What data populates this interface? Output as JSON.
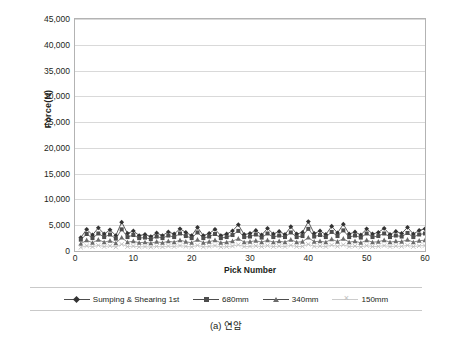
{
  "caption": "(a) 연암",
  "chart_data": {
    "type": "line",
    "title": "",
    "xlabel": "Pick Number",
    "ylabel": "Force(N)",
    "xlim": [
      0,
      60
    ],
    "ylim": [
      0,
      45000
    ],
    "grid": "horizontal",
    "legend_position": "bottom",
    "y_ticks": [
      0,
      5000,
      10000,
      15000,
      20000,
      25000,
      30000,
      35000,
      40000,
      45000
    ],
    "y_tick_labels": [
      "0",
      "5,000",
      "10,000",
      "15,000",
      "20,000",
      "25,000",
      "30,000",
      "35,000",
      "40,000",
      "45,000"
    ],
    "x_ticks": [
      0,
      10,
      20,
      30,
      40,
      50,
      60
    ],
    "x_tick_labels": [
      "0",
      "10",
      "20",
      "30",
      "40",
      "50",
      "60"
    ],
    "x": [
      1,
      2,
      3,
      4,
      5,
      6,
      7,
      8,
      9,
      10,
      11,
      12,
      13,
      14,
      15,
      16,
      17,
      18,
      19,
      20,
      21,
      22,
      23,
      24,
      25,
      26,
      27,
      28,
      29,
      30,
      31,
      32,
      33,
      34,
      35,
      36,
      37,
      38,
      39,
      40,
      41,
      42,
      43,
      44,
      45,
      46,
      47,
      48,
      49,
      50,
      51,
      52,
      53,
      54,
      55,
      56,
      57,
      58,
      59,
      60
    ],
    "series": [
      {
        "name": "Sumping & Shearing 1st",
        "marker": "diamond",
        "color": "#333333",
        "values": [
          2600,
          4200,
          3100,
          4500,
          3300,
          4100,
          3000,
          5600,
          3400,
          3900,
          3000,
          3200,
          2800,
          3500,
          3000,
          3700,
          3300,
          4300,
          3600,
          3000,
          4600,
          3000,
          3400,
          4200,
          3000,
          3300,
          3900,
          5100,
          3200,
          3400,
          4000,
          3100,
          4400,
          3300,
          3800,
          3200,
          4700,
          3300,
          3600,
          5700,
          3400,
          3900,
          3200,
          4800,
          3500,
          5200,
          3300,
          3700,
          3100,
          4300,
          3300,
          3600,
          4400,
          3200,
          3800,
          3400,
          4600,
          3300,
          4000,
          4300
        ]
      },
      {
        "name": "680mm",
        "marker": "square",
        "color": "#4d4d4d",
        "values": [
          2200,
          3300,
          2500,
          3400,
          2700,
          3200,
          2400,
          4200,
          2700,
          3100,
          2500,
          2600,
          2300,
          2800,
          2500,
          3000,
          2700,
          3400,
          2900,
          2500,
          3600,
          2500,
          2800,
          3300,
          2500,
          2700,
          3100,
          3900,
          2700,
          2800,
          3200,
          2600,
          3400,
          2700,
          3000,
          2700,
          3600,
          2700,
          2900,
          4300,
          2800,
          3100,
          2700,
          3700,
          2900,
          4000,
          2700,
          3000,
          2600,
          3400,
          2700,
          2900,
          3400,
          2700,
          3000,
          2800,
          3500,
          2700,
          3200,
          3400
        ]
      },
      {
        "name": "340mm",
        "marker": "triangle",
        "color": "#6b6b6b",
        "values": [
          1400,
          2100,
          1600,
          2200,
          1700,
          2000,
          1500,
          2600,
          1700,
          1900,
          1600,
          1700,
          1500,
          1800,
          1600,
          1900,
          1700,
          2100,
          1800,
          1600,
          2200,
          1600,
          1800,
          2100,
          1600,
          1700,
          1900,
          2400,
          1700,
          1800,
          2000,
          1700,
          2100,
          1700,
          1900,
          1700,
          2200,
          1700,
          1800,
          2600,
          1800,
          1900,
          1700,
          2300,
          1800,
          2400,
          1700,
          1900,
          1600,
          2100,
          1700,
          1800,
          2100,
          1700,
          1900,
          1800,
          2200,
          1700,
          2000,
          2100
        ]
      },
      {
        "name": "150mm",
        "marker": "x",
        "color": "#bdbdbd",
        "values": [
          700,
          1000,
          800,
          1100,
          850,
          1000,
          750,
          1300,
          850,
          950,
          800,
          850,
          750,
          900,
          800,
          950,
          850,
          1050,
          900,
          800,
          1100,
          800,
          900,
          1050,
          800,
          850,
          950,
          1200,
          850,
          900,
          1000,
          850,
          1050,
          850,
          950,
          850,
          1100,
          850,
          900,
          1300,
          900,
          950,
          850,
          1150,
          900,
          1200,
          850,
          950,
          800,
          1050,
          850,
          900,
          1050,
          850,
          950,
          900,
          1100,
          850,
          1000,
          1050
        ]
      }
    ]
  },
  "legend": {
    "items": [
      {
        "label": "Sumping & Shearing 1st",
        "marker": "diamond"
      },
      {
        "label": "680mm",
        "marker": "square"
      },
      {
        "label": "340mm",
        "marker": "triangle"
      },
      {
        "label": "150mm",
        "marker": "x"
      }
    ]
  }
}
